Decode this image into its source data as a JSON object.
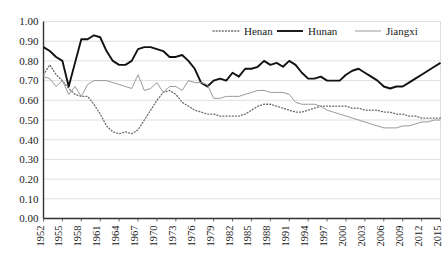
{
  "chart_data": {
    "type": "line",
    "title": "",
    "subtitle": "",
    "xlabel": "",
    "ylabel": "",
    "xlim": [
      1952,
      2015
    ],
    "ylim": [
      0.0,
      1.0
    ],
    "grid": true,
    "grid_axis": "y",
    "legend_position": "top-center",
    "ytick_labels": [
      "1.00",
      "0.90",
      "0.80",
      "0.70",
      "0.60",
      "0.50",
      "0.40",
      "0.30",
      "0.20",
      "0.10",
      "0.00"
    ],
    "ytick_values": [
      1.0,
      0.9,
      0.8,
      0.7,
      0.6,
      0.5,
      0.4,
      0.3,
      0.2,
      0.1,
      0.0
    ],
    "xtick_labels": [
      "1952",
      "1955",
      "1958",
      "1961",
      "1964",
      "1967",
      "1970",
      "1973",
      "1976",
      "1979",
      "1982",
      "1985",
      "1988",
      "1991",
      "1994",
      "1997",
      "2000",
      "2003",
      "2006",
      "2009",
      "2012",
      "2015"
    ],
    "xtick_values": [
      1952,
      1955,
      1958,
      1961,
      1964,
      1967,
      1970,
      1973,
      1976,
      1979,
      1982,
      1985,
      1988,
      1991,
      1994,
      1997,
      2000,
      2003,
      2006,
      2009,
      2012,
      2015
    ],
    "x": [
      1952,
      1953,
      1954,
      1955,
      1956,
      1957,
      1958,
      1959,
      1960,
      1961,
      1962,
      1963,
      1964,
      1965,
      1966,
      1967,
      1968,
      1969,
      1970,
      1971,
      1972,
      1973,
      1974,
      1975,
      1976,
      1977,
      1978,
      1979,
      1980,
      1981,
      1982,
      1983,
      1984,
      1985,
      1986,
      1987,
      1988,
      1989,
      1990,
      1991,
      1992,
      1993,
      1994,
      1995,
      1996,
      1997,
      1998,
      1999,
      2000,
      2001,
      2002,
      2003,
      2004,
      2005,
      2006,
      2007,
      2008,
      2009,
      2010,
      2011,
      2012,
      2013,
      2014,
      2015
    ],
    "series": [
      {
        "name": "Henan",
        "style": "dotted",
        "color": "#6b6b6b",
        "values": [
          0.73,
          0.78,
          0.73,
          0.7,
          0.66,
          0.63,
          0.62,
          0.62,
          0.58,
          0.53,
          0.47,
          0.44,
          0.43,
          0.44,
          0.43,
          0.45,
          0.5,
          0.55,
          0.6,
          0.64,
          0.65,
          0.63,
          0.59,
          0.57,
          0.55,
          0.54,
          0.53,
          0.53,
          0.52,
          0.52,
          0.52,
          0.52,
          0.53,
          0.55,
          0.57,
          0.58,
          0.58,
          0.57,
          0.56,
          0.55,
          0.54,
          0.54,
          0.55,
          0.56,
          0.57,
          0.57,
          0.57,
          0.57,
          0.57,
          0.56,
          0.56,
          0.55,
          0.55,
          0.55,
          0.54,
          0.54,
          0.53,
          0.53,
          0.52,
          0.52,
          0.51,
          0.51,
          0.51,
          0.51
        ]
      },
      {
        "name": "Hunan",
        "style": "solid-thick",
        "color": "#111111",
        "values": [
          0.87,
          0.85,
          0.82,
          0.8,
          0.67,
          0.79,
          0.91,
          0.91,
          0.93,
          0.92,
          0.85,
          0.8,
          0.78,
          0.78,
          0.8,
          0.86,
          0.87,
          0.87,
          0.86,
          0.85,
          0.82,
          0.82,
          0.83,
          0.8,
          0.76,
          0.69,
          0.67,
          0.7,
          0.71,
          0.7,
          0.74,
          0.72,
          0.76,
          0.76,
          0.77,
          0.8,
          0.78,
          0.79,
          0.77,
          0.8,
          0.78,
          0.74,
          0.71,
          0.71,
          0.72,
          0.7,
          0.7,
          0.7,
          0.73,
          0.75,
          0.76,
          0.74,
          0.72,
          0.7,
          0.67,
          0.66,
          0.67,
          0.67,
          0.69,
          0.71,
          0.73,
          0.75,
          0.77,
          0.79
        ]
      },
      {
        "name": "Jiangxi",
        "style": "solid-thin",
        "color": "#9a9a9a",
        "values": [
          0.72,
          0.71,
          0.67,
          0.7,
          0.63,
          0.67,
          0.62,
          0.68,
          0.7,
          0.7,
          0.7,
          0.69,
          0.68,
          0.67,
          0.66,
          0.73,
          0.65,
          0.66,
          0.69,
          0.64,
          0.67,
          0.67,
          0.65,
          0.7,
          0.69,
          0.69,
          0.68,
          0.61,
          0.61,
          0.62,
          0.62,
          0.62,
          0.63,
          0.64,
          0.65,
          0.65,
          0.64,
          0.64,
          0.64,
          0.63,
          0.59,
          0.58,
          0.58,
          0.58,
          0.57,
          0.55,
          0.54,
          0.53,
          0.52,
          0.51,
          0.5,
          0.49,
          0.48,
          0.47,
          0.46,
          0.46,
          0.46,
          0.47,
          0.47,
          0.48,
          0.49,
          0.49,
          0.5,
          0.5
        ]
      }
    ]
  },
  "legend": {
    "items": [
      {
        "label": "Henan"
      },
      {
        "label": "Hunan"
      },
      {
        "label": "Jiangxi"
      }
    ]
  }
}
